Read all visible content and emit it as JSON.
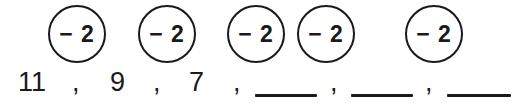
{
  "worksheet": {
    "type": "arithmetic-sequence-fill-in-the-blank",
    "operations": [
      {
        "label": "− 2",
        "x": 48,
        "y": 5
      },
      {
        "label": "− 2",
        "x": 138,
        "y": 5
      },
      {
        "label": "− 2",
        "x": 227,
        "y": 5
      },
      {
        "label": "− 2",
        "x": 297,
        "y": 5
      },
      {
        "label": "− 2",
        "x": 405,
        "y": 5
      }
    ],
    "sequence": {
      "terms": [
        {
          "kind": "value",
          "text": "11",
          "x": 18,
          "width": 34
        },
        {
          "kind": "comma",
          "text": ",",
          "x": 72
        },
        {
          "kind": "value",
          "text": "9",
          "x": 110,
          "width": 18
        },
        {
          "kind": "comma",
          "text": ",",
          "x": 153
        },
        {
          "kind": "value",
          "text": "7",
          "x": 189,
          "width": 18
        },
        {
          "kind": "comma",
          "text": ",",
          "x": 233
        },
        {
          "kind": "blank",
          "text": "",
          "x": 255,
          "width": 62
        },
        {
          "kind": "comma",
          "text": ",",
          "x": 330
        },
        {
          "kind": "blank",
          "text": "",
          "x": 351,
          "width": 62
        },
        {
          "kind": "comma",
          "text": ",",
          "x": 425
        },
        {
          "kind": "blank",
          "text": "",
          "x": 447,
          "width": 64
        }
      ]
    },
    "colors": {
      "ink": "#1a1a1a",
      "background": "#ffffff"
    }
  }
}
